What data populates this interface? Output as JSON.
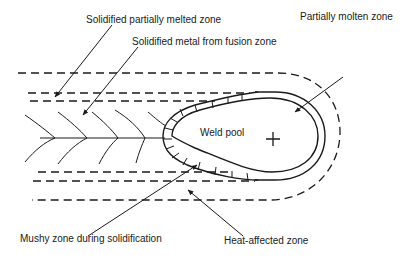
{
  "diagram": {
    "title": "",
    "labels": {
      "solidified_pmz": "Solidified partially melted zone",
      "solidified_metal": "Solidified metal from fusion zone",
      "partially_molten": "Partially molten zone",
      "weld_pool": "Weld pool",
      "mushy_zone": "Mushy zone during solidification",
      "haz": "Heat-affected zone"
    },
    "colors": {
      "line": "#1a1a1a",
      "background": "#ffffff"
    }
  }
}
